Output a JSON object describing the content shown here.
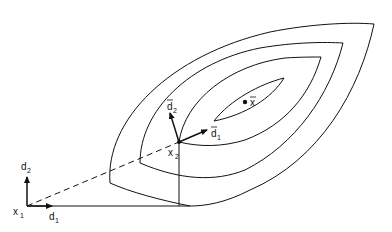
{
  "diagram": {
    "labels": {
      "x1": "x",
      "x1_sub": "1",
      "d1": "d",
      "d1_sub": "1",
      "d2": "d",
      "d2_sub": "2",
      "x2": "x",
      "x2_sub": "2",
      "d1bar": "d",
      "d1bar_sub": "1",
      "d2bar": "d",
      "d2bar_sub": "2",
      "xbar": "x"
    },
    "colors": {
      "stroke": "#111111",
      "background": "#ffffff"
    }
  }
}
